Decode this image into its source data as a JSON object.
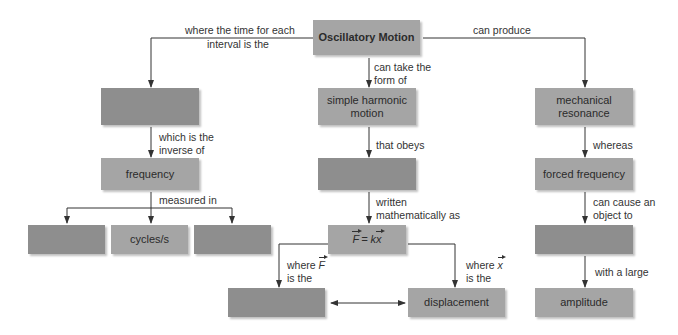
{
  "diagram": {
    "type": "concept-map",
    "colors": {
      "light_box": "#a5a5a5",
      "dark_box": "#8e8e8e",
      "line": "#333333",
      "background": "#ffffff"
    },
    "nodes": {
      "root": "Oscillatory Motion",
      "period_blank": "",
      "frequency": "frequency",
      "unit_blank_1": "",
      "cycles": "cycles/s",
      "unit_blank_2": "",
      "shm": "simple harmonic motion",
      "law_blank": "",
      "formula_F": "F",
      "formula_eq": "= k",
      "formula_x": "x",
      "force_blank": "",
      "displacement": "displacement",
      "resonance": "mechanical resonance",
      "forced_frequency": "forced frequency",
      "vibrate_blank": "",
      "amplitude": "amplitude"
    },
    "links": {
      "root_to_period_1": "where the time for each",
      "root_to_period_2": "interval is the",
      "root_to_shm_1": "can take the",
      "root_to_shm_2": "form of",
      "root_to_resonance": "can produce",
      "period_to_freq_1": "which is the",
      "period_to_freq_2": "inverse of",
      "freq_to_units": "measured in",
      "shm_to_law": "that obeys",
      "law_to_formula_1": "written",
      "law_to_formula_2": "mathematically as",
      "formula_to_force_1": "where",
      "formula_to_force_var": "F",
      "formula_to_force_2": "is the",
      "formula_to_disp_1": "where",
      "formula_to_disp_var": "x",
      "formula_to_disp_2": "is the",
      "resonance_to_forced": "whereas",
      "forced_to_vibrate_1": "can cause an",
      "forced_to_vibrate_2": "object to",
      "vibrate_to_amplitude": "with a large"
    }
  }
}
